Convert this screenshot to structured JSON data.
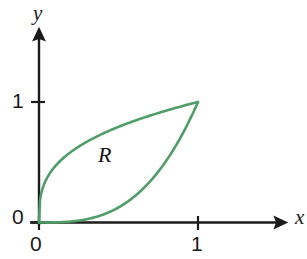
{
  "figure": {
    "title_visible": false,
    "background_color": "#ffffff"
  },
  "axes": {
    "x_axis_label": "x",
    "y_axis_label": "y",
    "axis_color": "#1b1b1b",
    "x_ticks": [
      {
        "label": "0",
        "value": 0
      },
      {
        "label": "1",
        "value": 1
      }
    ],
    "y_ticks": [
      {
        "label": "0",
        "value": 0
      },
      {
        "label": "1",
        "value": 1
      }
    ]
  },
  "annotations": [
    {
      "text": "R",
      "meaning": "shaded-region-label"
    }
  ],
  "chart_data": {
    "type": "line",
    "title": "",
    "xlabel": "x",
    "ylabel": "y",
    "xlim": [
      0,
      1.55
    ],
    "ylim": [
      0,
      1.68
    ],
    "grid": false,
    "legend": "none",
    "curve_color": "#4f9e68",
    "series": [
      {
        "name": "upper-curve",
        "expression": "y = x^(1/3)",
        "x": [
          0,
          0.02,
          0.05,
          0.1,
          0.2,
          0.3,
          0.4,
          0.5,
          0.6,
          0.7,
          0.8,
          0.9,
          1.0
        ],
        "values": [
          0,
          0.27,
          0.37,
          0.46,
          0.58,
          0.67,
          0.74,
          0.79,
          0.84,
          0.89,
          0.93,
          0.97,
          1.0
        ]
      },
      {
        "name": "lower-curve",
        "expression": "y = x^3",
        "x": [
          0,
          0.1,
          0.2,
          0.3,
          0.4,
          0.5,
          0.6,
          0.7,
          0.8,
          0.9,
          0.95,
          1.0
        ],
        "values": [
          0,
          0.001,
          0.008,
          0.027,
          0.064,
          0.125,
          0.216,
          0.343,
          0.512,
          0.729,
          0.857,
          1.0
        ]
      }
    ],
    "region": {
      "label": "R",
      "bounded_by": [
        "upper-curve",
        "lower-curve"
      ],
      "from_point": [
        0,
        0
      ],
      "to_point": [
        1,
        1
      ]
    }
  }
}
